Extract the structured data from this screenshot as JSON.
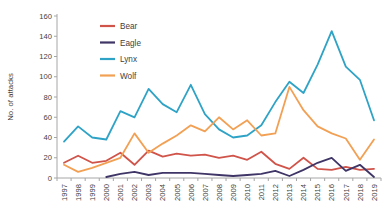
{
  "chart_data": {
    "type": "line",
    "title": "",
    "xlabel": "",
    "ylabel": "No. of attacks",
    "ylim": [
      0,
      160
    ],
    "ytick_step": 20,
    "grid": false,
    "legend_position": "top-left-inside",
    "axis_color": "#a6a6a6",
    "text_color": "#3f3f3f",
    "categories": [
      "1997",
      "1998",
      "1999",
      "2000",
      "2001",
      "2002",
      "2003",
      "2004",
      "2005",
      "2006",
      "2007",
      "2008",
      "2009",
      "2010",
      "2011",
      "2012",
      "2013",
      "2014",
      "2015",
      "2016",
      "2017",
      "2018",
      "2019"
    ],
    "series": [
      {
        "name": "Bear",
        "color": "#d0544a",
        "values": [
          15,
          22,
          15,
          17,
          25,
          13,
          27,
          21,
          24,
          22,
          23,
          20,
          22,
          18,
          26,
          14,
          9,
          20,
          9,
          8,
          11,
          8,
          9
        ]
      },
      {
        "name": "Eagle",
        "color": "#3f3566",
        "values": [
          null,
          null,
          null,
          1,
          4,
          6,
          3,
          5,
          5,
          5,
          4,
          3,
          2,
          3,
          4,
          7,
          2,
          8,
          15,
          20,
          7,
          13,
          1
        ]
      },
      {
        "name": "Lynx",
        "color": "#2ea3c6",
        "values": [
          36,
          51,
          40,
          38,
          66,
          60,
          88,
          73,
          65,
          92,
          63,
          48,
          40,
          42,
          52,
          75,
          95,
          84,
          112,
          145,
          110,
          97,
          57
        ]
      },
      {
        "name": "Wolf",
        "color": "#f2a054",
        "values": [
          13,
          6,
          10,
          15,
          20,
          44,
          25,
          34,
          42,
          52,
          46,
          60,
          48,
          57,
          42,
          44,
          90,
          67,
          51,
          44,
          39,
          18,
          38
        ]
      }
    ]
  }
}
